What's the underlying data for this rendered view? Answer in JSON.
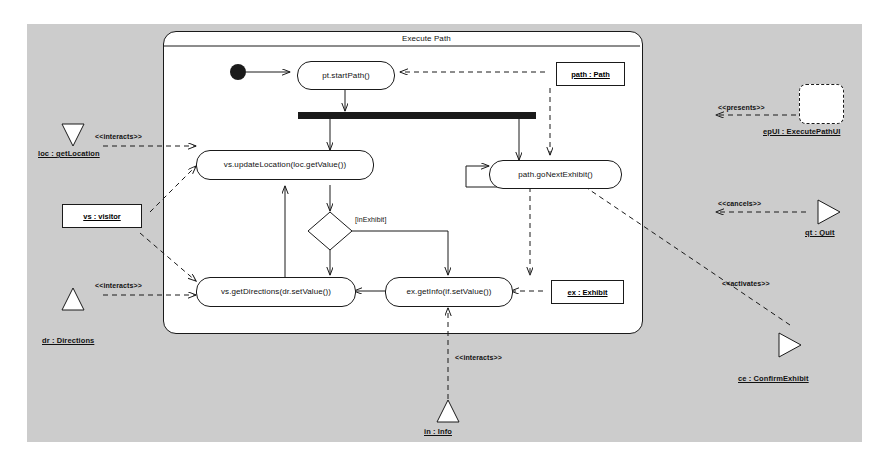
{
  "diagram": {
    "kind": "uml-activity-diagram",
    "frame_title": "Execute Path",
    "canvas_color": "#cccccc",
    "surface_color": "#ffffff",
    "line_color": "#1a1a1a"
  },
  "actions": [
    {
      "id": "start-path",
      "label": "pt.startPath()"
    },
    {
      "id": "update-location",
      "label": "vs.updateLocation(loc.getValue())"
    },
    {
      "id": "go-next-exhibit",
      "label": "path.goNextExhibit()"
    },
    {
      "id": "get-directions",
      "label": "vs.getDirections(dr.setValue())"
    },
    {
      "id": "get-info",
      "label": "ex.getInfo(if.setValue())"
    }
  ],
  "guards": [
    {
      "id": "in-exhibit",
      "label": "[inExhibit]"
    }
  ],
  "objects": [
    {
      "id": "path-obj",
      "label": "path : Path"
    },
    {
      "id": "visitor-obj",
      "label": "vs : visitor"
    },
    {
      "id": "exhibit-obj",
      "label": "ex : Exhibit"
    }
  ],
  "actors": [
    {
      "id": "get-location",
      "label": "loc : getLocation",
      "shape": "triangle-down"
    },
    {
      "id": "directions",
      "label": "dr : Directions",
      "shape": "triangle-up"
    },
    {
      "id": "info",
      "label": "in : Info",
      "shape": "triangle-up"
    },
    {
      "id": "quit",
      "label": "qt : Quit",
      "shape": "triangle-right"
    },
    {
      "id": "confirm-exhibit",
      "label": "ce : ConfirmExhibit",
      "shape": "triangle-right"
    },
    {
      "id": "execute-path-ui",
      "label": "epUI : ExecutePathUI",
      "shape": "rounded-dashed-box"
    }
  ],
  "stereotypes": [
    {
      "id": "interacts-location",
      "label": "<<interacts>>"
    },
    {
      "id": "interacts-directions",
      "label": "<<interacts>>"
    },
    {
      "id": "interacts-info",
      "label": "<<interacts>>"
    },
    {
      "id": "presents",
      "label": "<<presents>>"
    },
    {
      "id": "cancels",
      "label": "<<cancels>>"
    },
    {
      "id": "activates",
      "label": "<<activates>>"
    }
  ],
  "control_nodes": [
    {
      "id": "initial-node",
      "type": "initial"
    },
    {
      "id": "fork-bar",
      "type": "fork"
    },
    {
      "id": "decision",
      "type": "decision"
    }
  ]
}
